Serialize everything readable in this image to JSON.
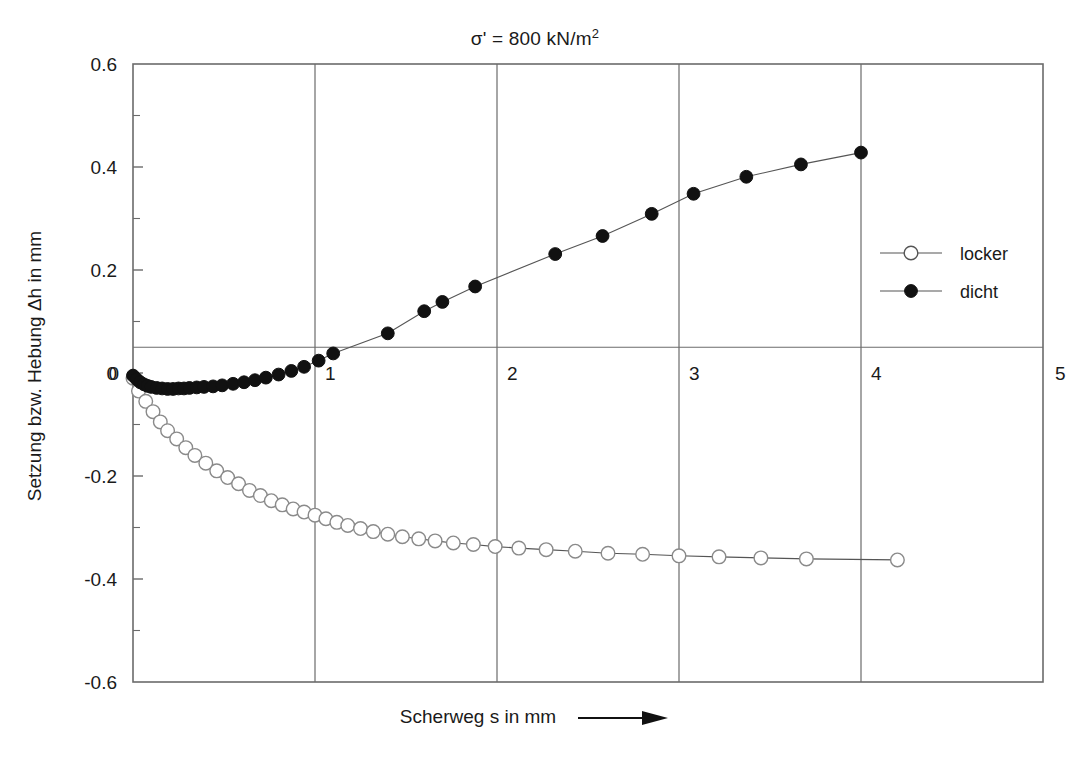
{
  "chart_data": {
    "type": "scatter",
    "title_main": "σ' = 800 kN/m",
    "title_sup": "2",
    "xlabel": "Scherweg s  in mm",
    "ylabel": "Setzung bzw. Hebung Δh in mm",
    "xlim": [
      0,
      5
    ],
    "ylim": [
      -0.6,
      0.6
    ],
    "xticks": [
      0,
      1,
      2,
      3,
      4,
      5
    ],
    "xtick_labels": [
      "0",
      "1",
      "2",
      "3",
      "4",
      "5"
    ],
    "yticks": [
      0.6,
      0.4,
      0.2,
      0,
      -0.2,
      -0.4,
      -0.6
    ],
    "ytick_labels": [
      "0.6",
      "0.4",
      "0.2",
      "0",
      "-0.2",
      "-0.4",
      "-0.6"
    ],
    "y_minor_ticks": [
      0.5,
      0.3,
      0.1,
      -0.1,
      -0.3,
      -0.5
    ],
    "grid": "vertical gridlines at each integer x; horizontal reference line near y=0.05",
    "reference_line_y": 0.05,
    "legend_position": "right-middle",
    "marker_colors": {
      "locker": "#ffffff",
      "dicht": "#111111",
      "line": "#555555",
      "frame": "#6b6b6b"
    },
    "series": [
      {
        "name": "locker",
        "marker": "open-circle",
        "x": [
          0.0,
          0.03,
          0.07,
          0.11,
          0.15,
          0.19,
          0.24,
          0.29,
          0.34,
          0.4,
          0.46,
          0.52,
          0.58,
          0.64,
          0.7,
          0.76,
          0.82,
          0.88,
          0.94,
          1.0,
          1.06,
          1.12,
          1.18,
          1.25,
          1.32,
          1.4,
          1.48,
          1.57,
          1.66,
          1.76,
          1.87,
          1.99,
          2.12,
          2.27,
          2.43,
          2.61,
          2.8,
          3.0,
          3.22,
          3.45,
          3.7,
          4.2
        ],
        "y": [
          -0.01,
          -0.035,
          -0.055,
          -0.075,
          -0.095,
          -0.112,
          -0.128,
          -0.145,
          -0.16,
          -0.175,
          -0.19,
          -0.203,
          -0.215,
          -0.228,
          -0.238,
          -0.248,
          -0.256,
          -0.264,
          -0.27,
          -0.276,
          -0.283,
          -0.29,
          -0.296,
          -0.302,
          -0.308,
          -0.313,
          -0.318,
          -0.322,
          -0.326,
          -0.33,
          -0.333,
          -0.337,
          -0.34,
          -0.343,
          -0.346,
          -0.35,
          -0.352,
          -0.355,
          -0.357,
          -0.359,
          -0.361,
          -0.363
        ]
      },
      {
        "name": "dicht",
        "marker": "filled-circle",
        "x": [
          0.0,
          0.02,
          0.04,
          0.06,
          0.08,
          0.1,
          0.13,
          0.16,
          0.19,
          0.22,
          0.25,
          0.28,
          0.31,
          0.35,
          0.39,
          0.44,
          0.49,
          0.55,
          0.61,
          0.67,
          0.73,
          0.8,
          0.87,
          0.94,
          1.02,
          1.1,
          1.4,
          1.6,
          1.7,
          1.88,
          2.32,
          2.58,
          2.85,
          3.08,
          3.37,
          3.67,
          4.0
        ],
        "y": [
          -0.005,
          -0.012,
          -0.018,
          -0.022,
          -0.025,
          -0.027,
          -0.029,
          -0.03,
          -0.031,
          -0.031,
          -0.03,
          -0.03,
          -0.029,
          -0.028,
          -0.027,
          -0.026,
          -0.024,
          -0.021,
          -0.018,
          -0.014,
          -0.009,
          -0.003,
          0.004,
          0.012,
          0.024,
          0.038,
          0.077,
          0.12,
          0.138,
          0.168,
          0.231,
          0.266,
          0.309,
          0.348,
          0.381,
          0.405,
          0.428
        ]
      }
    ],
    "legend": [
      {
        "label": "locker",
        "marker": "open-circle"
      },
      {
        "label": "dicht",
        "marker": "filled-circle"
      }
    ]
  }
}
